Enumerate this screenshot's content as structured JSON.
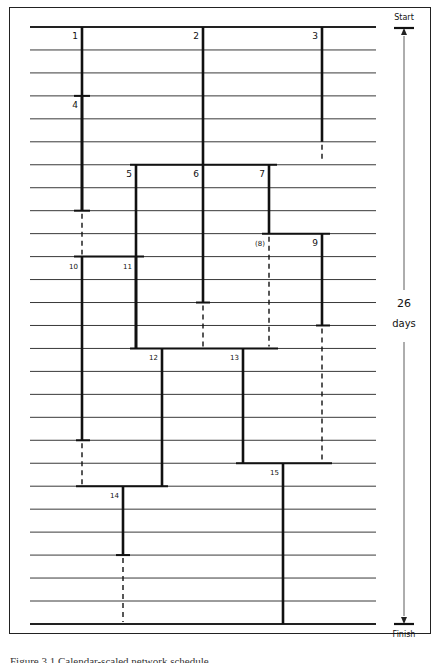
{
  "diagram": {
    "type": "precedence-time-chart",
    "duration_label": "26",
    "duration_unit": "days",
    "start_label": "Start",
    "finish_label": "Finish",
    "grid": {
      "x0": 30,
      "x1": 376,
      "y_start": 27,
      "row_height": 22.96,
      "rows": 26
    },
    "activities": [
      {
        "id": "1",
        "label": "1",
        "x": 82,
        "start_day": 0,
        "end_day": 8,
        "float_to": 10
      },
      {
        "id": "2",
        "label": "2",
        "x": 203,
        "start_day": 0,
        "end_day": 6
      },
      {
        "id": "3",
        "label": "3",
        "x": 322,
        "start_day": 0,
        "end_day": 5,
        "float_to": 6
      },
      {
        "id": "4",
        "label": "4",
        "x": 82,
        "start_day": 3,
        "end_day": 8
      },
      {
        "id": "5",
        "label": "5",
        "x": 136,
        "start_day": 6,
        "end_day": 14
      },
      {
        "id": "6",
        "label": "6",
        "x": 203,
        "start_day": 6,
        "end_day": 12,
        "float_to": 14
      },
      {
        "id": "7",
        "label": "7",
        "x": 269,
        "start_day": 6,
        "end_day": 9
      },
      {
        "id": "8",
        "label": "(8)",
        "x": 269,
        "start_day": 9,
        "end_day": 9,
        "float_to": 14
      },
      {
        "id": "9",
        "label": "9",
        "x": 322,
        "start_day": 9,
        "end_day": 13,
        "float_to": 19
      },
      {
        "id": "10",
        "label": "10",
        "x": 82,
        "start_day": 10,
        "end_day": 18,
        "float_to": 20
      },
      {
        "id": "11",
        "label": "11",
        "x": 136,
        "start_day": 10,
        "end_day": 14
      },
      {
        "id": "12",
        "label": "12",
        "x": 162,
        "start_day": 14,
        "end_day": 20
      },
      {
        "id": "13",
        "label": "13",
        "x": 243,
        "start_day": 14,
        "end_day": 19
      },
      {
        "id": "14",
        "label": "14",
        "x": 123,
        "start_day": 20,
        "end_day": 23,
        "float_to": 26
      },
      {
        "id": "15",
        "label": "15",
        "x": 283,
        "start_day": 19,
        "end_day": 26
      }
    ],
    "events": [
      {
        "day": 0,
        "x0": 30,
        "x1": 376
      },
      {
        "day": 3,
        "x0": 74,
        "x1": 90
      },
      {
        "day": 6,
        "x0": 130,
        "x1": 277
      },
      {
        "day": 8,
        "x0": 74,
        "x1": 90
      },
      {
        "day": 9,
        "x0": 262,
        "x1": 330
      },
      {
        "day": 10,
        "x0": 74,
        "x1": 144
      },
      {
        "day": 12,
        "x0": 196,
        "x1": 210
      },
      {
        "day": 13,
        "x0": 316,
        "x1": 330
      },
      {
        "day": 14,
        "x0": 130,
        "x1": 278
      },
      {
        "day": 18,
        "x0": 76,
        "x1": 90
      },
      {
        "day": 19,
        "x0": 236,
        "x1": 332
      },
      {
        "day": 20,
        "x0": 76,
        "x1": 168
      },
      {
        "day": 23,
        "x0": 116,
        "x1": 130
      },
      {
        "day": 26,
        "x0": 30,
        "x1": 376
      }
    ]
  },
  "caption": "Figure 3.1   Calendar-scaled network schedule"
}
